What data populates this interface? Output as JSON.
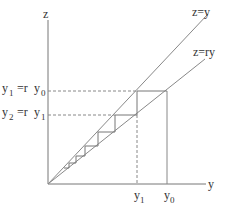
{
  "diagram": {
    "axes": {
      "vertical_label": "z",
      "horizontal_label": "y"
    },
    "lines": [
      {
        "label": "z=y"
      },
      {
        "label": "z=ry"
      }
    ],
    "z_labels": [
      {
        "lhs_base": "y",
        "lhs_sub": "1",
        "eq": " =r ",
        "rhs_base": "y",
        "rhs_sub": "0"
      },
      {
        "lhs_base": "y",
        "lhs_sub": "2",
        "eq": " =r ",
        "rhs_base": "y",
        "rhs_sub": "1"
      }
    ],
    "y_ticks": [
      {
        "base": "y",
        "sub": "1"
      },
      {
        "base": "y",
        "sub": "0"
      }
    ]
  }
}
